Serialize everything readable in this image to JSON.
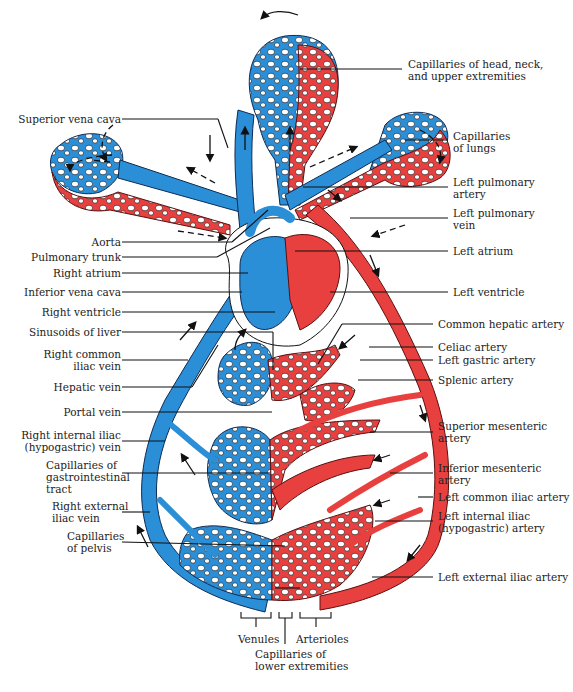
{
  "diagram": {
    "colors": {
      "veins_deoxygenated": "#2b8fd8",
      "arteries_oxygenated": "#e8403f",
      "outline": "#111111",
      "background": "#ffffff"
    },
    "left_labels": [
      {
        "id": "superior-vena-cava",
        "text": "Superior vena cava"
      },
      {
        "id": "aorta",
        "text": "Aorta"
      },
      {
        "id": "pulmonary-trunk",
        "text": "Pulmonary trunk"
      },
      {
        "id": "right-atrium",
        "text": "Right atrium"
      },
      {
        "id": "inferior-vena-cava",
        "text": "Inferior vena cava"
      },
      {
        "id": "right-ventricle",
        "text": "Right ventricle"
      },
      {
        "id": "sinusoids-of-liver",
        "text": "Sinusoids of liver"
      },
      {
        "id": "right-common-iliac-vein",
        "line1": "Right common",
        "line2": "iliac vein"
      },
      {
        "id": "hepatic-vein",
        "text": "Hepatic vein"
      },
      {
        "id": "portal-vein",
        "text": "Portal vein"
      },
      {
        "id": "right-internal-iliac-vein",
        "line1": "Right internal iliac",
        "line2": "(hypogastric) vein"
      },
      {
        "id": "capillaries-gi-tract",
        "line1": "Capillaries of",
        "line2": "gastrointestinal",
        "line3": "tract"
      },
      {
        "id": "right-external-iliac-vein",
        "line1": "Right external",
        "line2": "iliac vein"
      },
      {
        "id": "capillaries-of-pelvis",
        "line1": "Capillaries",
        "line2": "of pelvis"
      }
    ],
    "right_labels": [
      {
        "id": "capillaries-head-neck",
        "line1": "Capillaries of head, neck,",
        "line2": "and upper extremities"
      },
      {
        "id": "capillaries-of-lungs",
        "line1": "Capillaries",
        "line2": "of lungs"
      },
      {
        "id": "left-pulmonary-artery",
        "line1": "Left pulmonary",
        "line2": "artery"
      },
      {
        "id": "left-pulmonary-vein",
        "line1": "Left pulmonary",
        "line2": "vein"
      },
      {
        "id": "left-atrium",
        "text": "Left atrium"
      },
      {
        "id": "left-ventricle",
        "text": "Left ventricle"
      },
      {
        "id": "common-hepatic-artery",
        "text": "Common hepatic artery"
      },
      {
        "id": "celiac-artery",
        "text": "Celiac artery"
      },
      {
        "id": "left-gastric-artery",
        "text": "Left gastric artery"
      },
      {
        "id": "splenic-artery",
        "text": "Splenic artery"
      },
      {
        "id": "superior-mesenteric-artery",
        "line1": "Superior mesenteric",
        "line2": "artery"
      },
      {
        "id": "inferior-mesenteric-artery",
        "line1": "Inferior mesenteric",
        "line2": "artery"
      },
      {
        "id": "left-common-iliac-artery",
        "text": "Left common iliac artery"
      },
      {
        "id": "left-internal-iliac-artery",
        "line1": "Left internal iliac",
        "line2": "(hypogastric) artery"
      },
      {
        "id": "left-external-iliac-artery",
        "text": "Left external iliac artery"
      }
    ],
    "bottom_labels": {
      "venules": "Venules",
      "arterioles": "Arterioles",
      "capillaries_lower_line1": "Capillaries of",
      "capillaries_lower_line2": "lower extremities"
    }
  }
}
